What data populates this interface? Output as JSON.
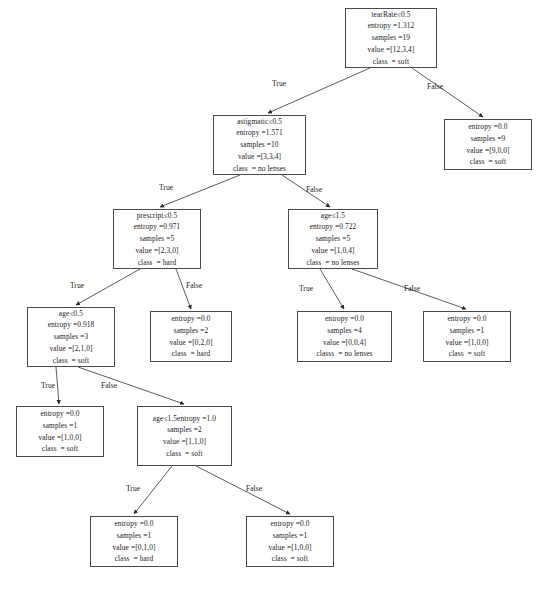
{
  "diagram": {
    "type": "decision-tree",
    "edge_labels": {
      "true": "True",
      "false": "False"
    },
    "stroke_color": "#4a4a4a",
    "text_color": "#1c1c1c",
    "background": "#ffffff"
  },
  "nodes": [
    {
      "id": "n0",
      "name": "root-teaRate",
      "x": 345,
      "y": 8,
      "w": 92,
      "h": 60,
      "lines": [
        "tearRate≤0.5",
        "entropy =1.312",
        "samples =19",
        "value =[12,3,4]",
        "class  = soft"
      ],
      "feature": "tearRate",
      "threshold": 0.5,
      "entropy": 1.312,
      "samples": 19,
      "value": [
        12,
        3,
        4
      ],
      "class": "soft"
    },
    {
      "id": "n1",
      "name": "node-astigmatic",
      "x": 213,
      "y": 115,
      "w": 93,
      "h": 60,
      "lines": [
        "astigmatic≤0.5",
        "entropy =1.571",
        "samples =10",
        "value =[3,3,4]",
        "class  = no lenses"
      ],
      "feature": "astigmatic",
      "threshold": 0.5,
      "entropy": 1.571,
      "samples": 10,
      "value": [
        3,
        3,
        4
      ],
      "class": "no lenses"
    },
    {
      "id": "n2",
      "name": "leaf-soft-9",
      "x": 444,
      "y": 119,
      "w": 88,
      "h": 51,
      "lines": [
        "entropy =0.0",
        "samples =9",
        "value =[9,0,0]",
        "class  = soft"
      ],
      "entropy": 0.0,
      "samples": 9,
      "value": [
        9,
        0,
        0
      ],
      "class": "soft"
    },
    {
      "id": "n3",
      "name": "node-prescript",
      "x": 113,
      "y": 209,
      "w": 88,
      "h": 60,
      "lines": [
        "prescript≤0.5",
        "entropy =0.971",
        "samples =5",
        "value =[2,3,0]",
        "class  = hard"
      ],
      "feature": "prescript",
      "threshold": 0.5,
      "entropy": 0.971,
      "samples": 5,
      "value": [
        2,
        3,
        0
      ],
      "class": "hard"
    },
    {
      "id": "n4",
      "name": "node-age-1-5",
      "x": 288,
      "y": 209,
      "w": 90,
      "h": 60,
      "lines": [
        "age≤1.5",
        "entropy =0.722",
        "samples =5",
        "value =[1,0,4]",
        "class  = no lenses"
      ],
      "feature": "age",
      "threshold": 1.5,
      "entropy": 0.722,
      "samples": 5,
      "value": [
        1,
        0,
        4
      ],
      "class": "no lenses"
    },
    {
      "id": "n5",
      "name": "node-age-0-5",
      "x": 27,
      "y": 307,
      "w": 88,
      "h": 60,
      "lines": [
        "age≤0.5",
        "entropy =0.918",
        "samples =3",
        "value =[2,1,0]",
        "class  = soft"
      ],
      "feature": "age",
      "threshold": 0.5,
      "entropy": 0.918,
      "samples": 3,
      "value": [
        2,
        1,
        0
      ],
      "class": "soft"
    },
    {
      "id": "n6",
      "name": "leaf-hard-2",
      "x": 150,
      "y": 311,
      "w": 82,
      "h": 51,
      "lines": [
        "entropy =0.0",
        "samples =2",
        "value =[0,2,0]",
        "class  = hard"
      ],
      "entropy": 0.0,
      "samples": 2,
      "value": [
        0,
        2,
        0
      ],
      "class": "hard"
    },
    {
      "id": "n7",
      "name": "leaf-no-lenses-4",
      "x": 297,
      "y": 311,
      "w": 95,
      "h": 51,
      "lines": [
        "entropy =0.0",
        "samples =4",
        "value =[0,0,4]",
        "classs  = no lenses"
      ],
      "entropy": 0.0,
      "samples": 4,
      "value": [
        0,
        0,
        4
      ],
      "class": "no lenses"
    },
    {
      "id": "n8",
      "name": "leaf-soft-1-right",
      "x": 423,
      "y": 311,
      "w": 88,
      "h": 51,
      "lines": [
        "entropy =0.0",
        "samples =1",
        "value =[1,0,0]",
        "class  = soft"
      ],
      "entropy": 0.0,
      "samples": 1,
      "value": [
        1,
        0,
        0
      ],
      "class": "soft"
    },
    {
      "id": "n9",
      "name": "leaf-soft-1-left",
      "x": 16,
      "y": 406,
      "w": 88,
      "h": 51,
      "lines": [
        "entropy =0.0",
        "samples =1",
        "value =[1,0,0]",
        "class  = soft"
      ],
      "entropy": 0.0,
      "samples": 1,
      "value": [
        1,
        0,
        0
      ],
      "class": "soft"
    },
    {
      "id": "n10",
      "name": "node-age-1-5-lower",
      "x": 137,
      "y": 406,
      "w": 95,
      "h": 60,
      "lines": [
        "age≤1.5entropy =1.0",
        "samples =2",
        "value =[1,1,0]",
        "class  = soft"
      ],
      "feature": "age",
      "threshold": 1.5,
      "entropy": 1.0,
      "samples": 2,
      "value": [
        1,
        1,
        0
      ],
      "class": "soft"
    },
    {
      "id": "n11",
      "name": "leaf-hard-1",
      "x": 90,
      "y": 516,
      "w": 88,
      "h": 51,
      "lines": [
        "entropy =0.0",
        "samples =1",
        "value =[0,1,0]",
        "class  = hard"
      ],
      "entropy": 0.0,
      "samples": 1,
      "value": [
        0,
        1,
        0
      ],
      "class": "hard"
    },
    {
      "id": "n12",
      "name": "leaf-soft-1-bottom",
      "x": 246,
      "y": 516,
      "w": 88,
      "h": 51,
      "lines": [
        "entropy =0.0",
        "samples =1",
        "value =[1,0,0]",
        "class  = soft"
      ],
      "entropy": 0.0,
      "samples": 1,
      "value": [
        1,
        0,
        0
      ],
      "class": "soft"
    }
  ],
  "edges": [
    {
      "from": "n0",
      "to": "n1",
      "branch": "True",
      "x1": 370,
      "y1": 68,
      "x2": 268,
      "y2": 113,
      "lx": 272,
      "ly": 79
    },
    {
      "from": "n0",
      "to": "n2",
      "branch": "False",
      "x1": 412,
      "y1": 68,
      "x2": 483,
      "y2": 117,
      "lx": 427,
      "ly": 82
    },
    {
      "from": "n1",
      "to": "n3",
      "branch": "True",
      "x1": 240,
      "y1": 175,
      "x2": 160,
      "y2": 207,
      "lx": 159,
      "ly": 183
    },
    {
      "from": "n1",
      "to": "n4",
      "branch": "False",
      "x1": 282,
      "y1": 175,
      "x2": 330,
      "y2": 207,
      "lx": 306,
      "ly": 185
    },
    {
      "from": "n3",
      "to": "n5",
      "branch": "True",
      "x1": 140,
      "y1": 269,
      "x2": 76,
      "y2": 305,
      "lx": 70,
      "ly": 281
    },
    {
      "from": "n3",
      "to": "n6",
      "branch": "False",
      "x1": 176,
      "y1": 269,
      "x2": 191,
      "y2": 309,
      "lx": 186,
      "ly": 281
    },
    {
      "from": "n4",
      "to": "n7",
      "branch": "True",
      "x1": 320,
      "y1": 269,
      "x2": 344,
      "y2": 309,
      "lx": 299,
      "ly": 284
    },
    {
      "from": "n4",
      "to": "n8",
      "branch": "False",
      "x1": 352,
      "y1": 269,
      "x2": 466,
      "y2": 309,
      "lx": 404,
      "ly": 284
    },
    {
      "from": "n5",
      "to": "n9",
      "branch": "True",
      "x1": 56,
      "y1": 367,
      "x2": 59,
      "y2": 404,
      "lx": 41,
      "ly": 381
    },
    {
      "from": "n5",
      "to": "n10",
      "branch": "False",
      "x1": 78,
      "y1": 367,
      "x2": 184,
      "y2": 404,
      "lx": 101,
      "ly": 381
    },
    {
      "from": "n10",
      "to": "n11",
      "branch": "True",
      "x1": 172,
      "y1": 466,
      "x2": 134,
      "y2": 514,
      "lx": 126,
      "ly": 484
    },
    {
      "from": "n10",
      "to": "n12",
      "branch": "False",
      "x1": 196,
      "y1": 466,
      "x2": 290,
      "y2": 514,
      "lx": 246,
      "ly": 484
    }
  ]
}
